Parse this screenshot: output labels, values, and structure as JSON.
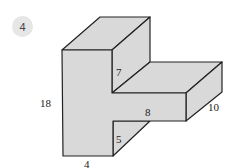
{
  "problem": {
    "number": "4"
  },
  "figure": {
    "type": "3d-prism-diagram",
    "fill_color": "#d9d9d9",
    "edge_color": "#222222",
    "labels": {
      "height": "18",
      "base_width": "4",
      "upper_depth_segment": "7",
      "arm_length": "8",
      "arm_depth": "10",
      "lower_segment": "5"
    }
  }
}
